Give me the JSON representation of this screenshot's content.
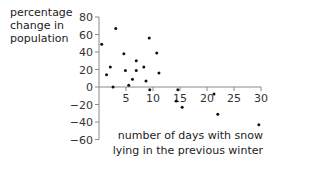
{
  "chart_data": {
    "type": "scatter",
    "title": "",
    "xlabel": "number of days with snow lying in the previous winter",
    "xlabel_lines": [
      "number of days with snow",
      "lying in the previous winter"
    ],
    "ylabel": "percentage change in population",
    "ylabel_lines": [
      "percentage",
      "change in",
      "population"
    ],
    "xlim": [
      0,
      30
    ],
    "ylim": [
      -60,
      80
    ],
    "x_ticks": [
      5,
      10,
      15,
      20,
      25,
      30
    ],
    "y_ticks": [
      80,
      60,
      40,
      20,
      0,
      -20,
      -40,
      -60
    ],
    "y_tick_labels": [
      "80",
      "60",
      "40",
      "20",
      "0",
      "−20",
      "−40",
      "−60"
    ],
    "grid": false,
    "legend": null,
    "series": [
      {
        "name": "population change",
        "points": [
          {
            "x": 0.5,
            "y": 49
          },
          {
            "x": 1.4,
            "y": 14
          },
          {
            "x": 2.1,
            "y": 23
          },
          {
            "x": 2.6,
            "y": 0
          },
          {
            "x": 3.1,
            "y": 67
          },
          {
            "x": 4.6,
            "y": 38
          },
          {
            "x": 4.9,
            "y": 19
          },
          {
            "x": 5.5,
            "y": 2
          },
          {
            "x": 6.2,
            "y": 9
          },
          {
            "x": 6.9,
            "y": 30
          },
          {
            "x": 6.9,
            "y": 19
          },
          {
            "x": 8.3,
            "y": 23
          },
          {
            "x": 8.7,
            "y": 7
          },
          {
            "x": 9.3,
            "y": 56
          },
          {
            "x": 9.4,
            "y": -3
          },
          {
            "x": 10.7,
            "y": 39
          },
          {
            "x": 11.1,
            "y": 16
          },
          {
            "x": 14.6,
            "y": -3
          },
          {
            "x": 14.3,
            "y": -16
          },
          {
            "x": 15.4,
            "y": -23
          },
          {
            "x": 21.3,
            "y": -8
          },
          {
            "x": 22.0,
            "y": -31
          },
          {
            "x": 29.6,
            "y": -43
          }
        ]
      }
    ]
  },
  "colors": {
    "axis": "#8a8a8a",
    "point": "#111111",
    "text": "#222222"
  }
}
